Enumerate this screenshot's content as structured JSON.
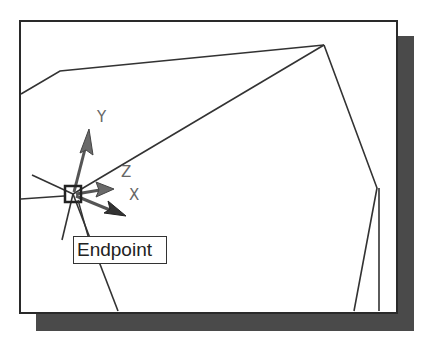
{
  "viewport": {
    "shadow_color": "#4a4a4a",
    "frame_color": "#2a2a2a",
    "background": "#ffffff"
  },
  "ucs_icon": {
    "labels": {
      "x": "X",
      "y": "Y",
      "z": "Z"
    },
    "arrow_color": "#777777"
  },
  "osnap": {
    "marker": "endpoint-square",
    "tooltip": "Endpoint"
  },
  "geometry": {
    "line_color": "#333333"
  }
}
